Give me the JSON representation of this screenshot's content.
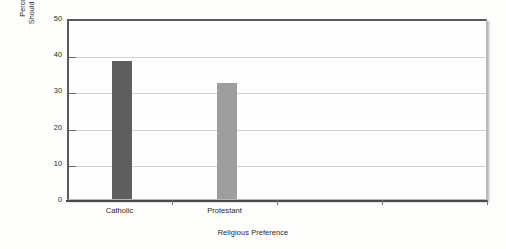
{
  "chart_data": {
    "type": "bar",
    "title": "",
    "categories": [
      "Catholic",
      "Protestant"
    ],
    "values": [
      38,
      32
    ],
    "series": [
      {
        "name": "Percentage Saying Abortion Should Be Legal for Any Reason",
        "values": [
          38,
          32
        ],
        "colors": [
          "#5f5f5f",
          "#9e9e9e"
        ]
      }
    ],
    "xlabel": "Religious Preference",
    "ylabel": "Percentage Saying Abortion Should Be Legal for Any Reason",
    "ylabel_lines": [
      "Percentage Saying Abortion",
      "Should Be Legal for Any Reason"
    ],
    "ylim": [
      0,
      50
    ],
    "ytick_values": [
      0,
      10,
      20,
      30,
      40,
      50
    ],
    "ytick_labels": [
      "0",
      "10",
      "20",
      "30",
      "40",
      "50"
    ],
    "grid": true,
    "grid_axis": "y",
    "legend": false,
    "legend_position": "none",
    "bar_colors": {
      "catholic": "#5f5f5f",
      "protestant": "#9e9e9e"
    },
    "frame_color": "#59595b",
    "gridline_color": "#d2d2d4",
    "plot_background": "#fefefe",
    "figure_background": "#fdfdfc"
  }
}
